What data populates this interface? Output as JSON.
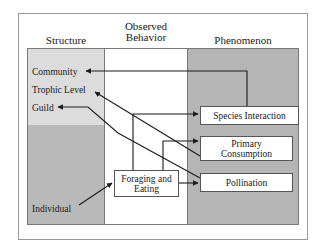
{
  "headers": {
    "structure": "Structure",
    "behavior_line1": "Observed",
    "behavior_line2": "Behavior",
    "phenomenon": "Phenomenon"
  },
  "structure_levels": {
    "community": "Community",
    "trophic_level": "Trophic Level",
    "guild": "Guild",
    "individual": "Individual"
  },
  "behavior": {
    "foraging_line1": "Foraging and",
    "foraging_line2": "Eating"
  },
  "phenomena": {
    "species_interaction": "Species Interaction",
    "primary_consumption_line1": "Primary",
    "primary_consumption_line2": "Consumption",
    "pollination": "Pollination"
  },
  "colors": {
    "structure_top_fill": "#dcdcdc",
    "structure_bottom_fill": "#b9b9b9",
    "phenomenon_fill": "#b5b5b5",
    "arrow": "#1a1a1a"
  },
  "edges": [
    {
      "from": "Individual",
      "to": "Foraging and Eating"
    },
    {
      "from": "Foraging and Eating",
      "to": "Species Interaction"
    },
    {
      "from": "Foraging and Eating",
      "to": "Primary Consumption"
    },
    {
      "from": "Foraging and Eating",
      "to": "Pollination"
    },
    {
      "from": "Species Interaction",
      "to": "Community"
    },
    {
      "from": "Primary Consumption",
      "to": "Trophic Level"
    },
    {
      "from": "Pollination",
      "to": "Guild"
    }
  ]
}
